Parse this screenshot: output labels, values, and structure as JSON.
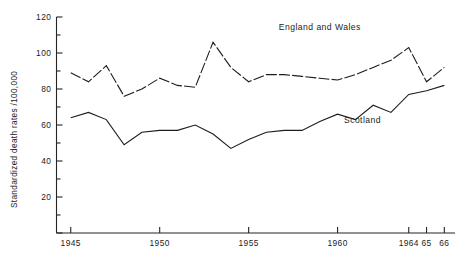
{
  "chart_data": {
    "type": "line",
    "title": "",
    "xlabel": "",
    "ylabel": "Standardized death rates /100,000",
    "xlim": [
      1944.2,
      1966.6
    ],
    "ylim": [
      0,
      120
    ],
    "grid": false,
    "legend_position": "inline-annotation",
    "y_ticks": [
      0,
      20,
      40,
      60,
      80,
      100,
      120
    ],
    "y_tick_labels": [
      "",
      "20",
      "40",
      "60",
      "80",
      "100",
      "120"
    ],
    "y_minor_ticks": [
      10,
      30,
      50,
      70,
      90,
      110
    ],
    "x_ticks": [
      1945,
      1950,
      1955,
      1960,
      1964,
      1965,
      1966
    ],
    "x_tick_labels": [
      "1945",
      "1950",
      "1955",
      "1960",
      "1964",
      "65",
      "66"
    ],
    "x": [
      1945,
      1946,
      1947,
      1948,
      1949,
      1950,
      1951,
      1952,
      1953,
      1954,
      1955,
      1956,
      1957,
      1958,
      1959,
      1960,
      1961,
      1962,
      1963,
      1964,
      1965,
      1966
    ],
    "series": [
      {
        "name": "England and Wales",
        "style": "dashed",
        "label_x": 1959.0,
        "label_y": 113,
        "values": [
          89,
          84,
          93,
          76,
          80,
          86,
          82,
          81,
          106,
          92,
          84,
          88,
          88,
          87,
          86,
          85,
          88,
          92,
          96,
          103,
          84,
          92
        ]
      },
      {
        "name": "Scotland",
        "style": "solid",
        "label_x": 1961.4,
        "label_y": 61,
        "values": [
          64,
          67,
          63,
          49,
          56,
          57,
          57,
          60,
          55,
          47,
          52,
          56,
          57,
          57,
          62,
          66,
          63,
          71,
          67,
          77,
          79,
          82
        ]
      }
    ]
  }
}
